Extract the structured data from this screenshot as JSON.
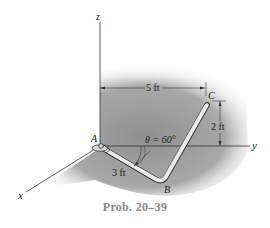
{
  "figure": {
    "caption": "Prob. 20–39",
    "axes": {
      "x_label": "x",
      "y_label": "y",
      "z_label": "z"
    },
    "points": {
      "A": "A",
      "B": "B",
      "C": "C"
    },
    "dimensions": {
      "horizontal_AC": "5 ft",
      "vertical_C": "2 ft",
      "segment_AB": "3 ft",
      "angle": "θ = 60°"
    },
    "colors": {
      "shading": "#9a9a9a",
      "rod_fill": "#e8e8e8",
      "rod_outline": "#222222",
      "lines": "#333333",
      "caption": "#8a8a8a"
    }
  }
}
